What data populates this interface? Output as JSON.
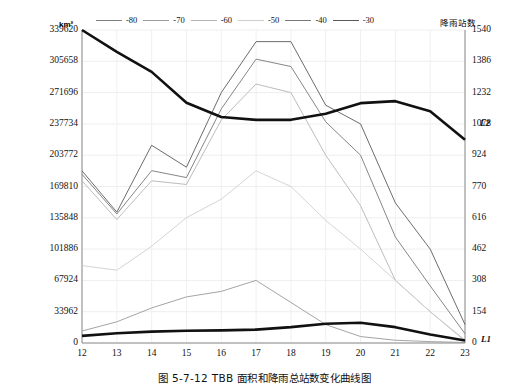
{
  "caption": "图 5-7-12    TBB 面积和降雨总站数变化曲线图",
  "axes": {
    "left_title": "km²",
    "right_title": "降雨站数",
    "left_ticks": [
      "339620",
      "305658",
      "271696",
      "237734",
      "203772",
      "169810",
      "135848",
      "101886",
      "67924",
      "33962",
      "0"
    ],
    "right_ticks": [
      "1540",
      "1386",
      "1232",
      "1078",
      "924",
      "770",
      "616",
      "462",
      "308",
      "154",
      "0"
    ],
    "x_ticks": [
      "12",
      "13",
      "14",
      "15",
      "16",
      "17",
      "18",
      "19",
      "20",
      "21",
      "22",
      "23"
    ]
  },
  "legend": {
    "items": [
      {
        "label": "-80",
        "color": "#808080"
      },
      {
        "label": "-70",
        "color": "#9a9a9a"
      },
      {
        "label": "-60",
        "color": "#b4b4b4"
      },
      {
        "label": "-50",
        "color": "#cfcfcf"
      },
      {
        "label": "-40",
        "color": "#787878"
      },
      {
        "label": "-30",
        "color": "#5a5a5a"
      }
    ]
  },
  "end_labels": {
    "l1": "L1",
    "l2": "L2"
  },
  "chart_data": {
    "type": "line",
    "title": "TBB 面积和降雨总站数变化曲线图",
    "xlabel": "",
    "ylabel": "km²",
    "y2label": "降雨站数",
    "x": [
      12,
      13,
      14,
      15,
      16,
      17,
      18,
      19,
      20,
      21,
      22,
      23
    ],
    "ylim": [
      0,
      339620
    ],
    "y2lim": [
      0,
      1540
    ],
    "grid": true,
    "legend_position": "top",
    "series": [
      {
        "name": "-30",
        "axis": "left",
        "color": "#5a5a5a",
        "width": 0.9,
        "values": [
          186800,
          142000,
          214500,
          190800,
          271700,
          327000,
          327000,
          258000,
          237700,
          152000,
          101900,
          20000
        ]
      },
      {
        "name": "-40",
        "axis": "left",
        "color": "#787878",
        "width": 0.9,
        "values": [
          183000,
          140000,
          187000,
          179500,
          254000,
          308000,
          300000,
          240000,
          203772,
          115000,
          62000,
          10000
        ]
      },
      {
        "name": "-50",
        "axis": "left",
        "color": "#b4b4b4",
        "width": 0.9,
        "values": [
          176000,
          134000,
          176000,
          172000,
          242000,
          281000,
          271696,
          203772,
          149000,
          68000,
          34000,
          3000
        ]
      },
      {
        "name": "-60",
        "axis": "left",
        "color": "#cfcfcf",
        "width": 0.9,
        "values": [
          84000,
          79000,
          105000,
          136000,
          156000,
          186800,
          169810,
          133000,
          101886,
          68000,
          34000,
          2000
        ]
      },
      {
        "name": "-70",
        "axis": "left",
        "color": "#9a9a9a",
        "width": 0.9,
        "values": [
          13000,
          23000,
          38000,
          50000,
          56000,
          67924,
          44000,
          20000,
          7000,
          3000,
          1500,
          600
        ]
      },
      {
        "name": "L2",
        "axis": "right",
        "color": "#111111",
        "width": 2.6,
        "values": [
          1540,
          1432,
          1334,
          1182,
          1112,
          1098,
          1098,
          1128,
          1180,
          1190,
          1140,
          1000
        ]
      },
      {
        "name": "L1",
        "axis": "right",
        "color": "#111111",
        "width": 2.6,
        "values": [
          35,
          48,
          56,
          60,
          62,
          66,
          78,
          95,
          100,
          78,
          42,
          12
        ]
      }
    ]
  }
}
